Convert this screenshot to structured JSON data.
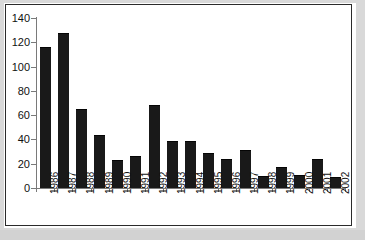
{
  "chart_data": {
    "type": "bar",
    "title": "",
    "subtitle": "",
    "xlabel": "",
    "ylabel": "",
    "categories": [
      "1986",
      "1987",
      "1988",
      "1989",
      "1990",
      "1991",
      "1992",
      "1993",
      "1994",
      "1995",
      "1996",
      "1997",
      "1998",
      "1999",
      "2000",
      "2001",
      "2002"
    ],
    "values": [
      116,
      128,
      65,
      44,
      23,
      26,
      68,
      39,
      39,
      29,
      24,
      31,
      10,
      17,
      11,
      24,
      9
    ],
    "series": [
      {
        "name": "",
        "values": [
          116,
          128,
          65,
          44,
          23,
          26,
          68,
          39,
          39,
          29,
          24,
          31,
          10,
          17,
          11,
          24,
          9
        ]
      }
    ],
    "ylim": [
      0,
      140
    ],
    "ytick_values": [
      0,
      20,
      40,
      60,
      80,
      100,
      120,
      140
    ],
    "ytick_labels": [
      "0",
      "20",
      "40",
      "60",
      "80",
      "100",
      "120",
      "140"
    ],
    "xtick_labels": [
      "1986",
      "1987",
      "1988",
      "1989",
      "1990",
      "1991",
      "1992",
      "1993",
      "1994",
      "1995",
      "1996",
      "1997",
      "1998",
      "1999",
      "2000",
      "2001",
      "2002"
    ],
    "xtick_label_rotation": "90",
    "grid": false,
    "legend": false,
    "legend_position": "none",
    "bar_color": "#191919",
    "axis_color": "#7a7a7a",
    "plot_background": "#ffffff",
    "page_background": "#d9d9d9",
    "border_color": "#2b2b2b",
    "annotations": []
  }
}
